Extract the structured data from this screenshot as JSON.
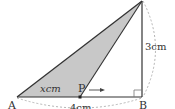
{
  "figure": {
    "type": "right triangle with moving point",
    "vertices": {
      "A": {
        "label": "A",
        "x": 17,
        "y": 97
      },
      "B": {
        "label": "B",
        "x": 142,
        "y": 97
      },
      "C": {
        "label": "",
        "x": 142,
        "y": 1
      },
      "P": {
        "label": "P",
        "x": 80,
        "y": 97
      }
    },
    "labels": {
      "ap_length": "xcm",
      "ab_length": "4cm",
      "bc_length": "3cm",
      "point_a": "A",
      "point_b": "B",
      "point_p": "P"
    },
    "colors": {
      "shade": "#c8c8c8",
      "line": "#333333",
      "dashed": "#b0b0b0"
    }
  }
}
